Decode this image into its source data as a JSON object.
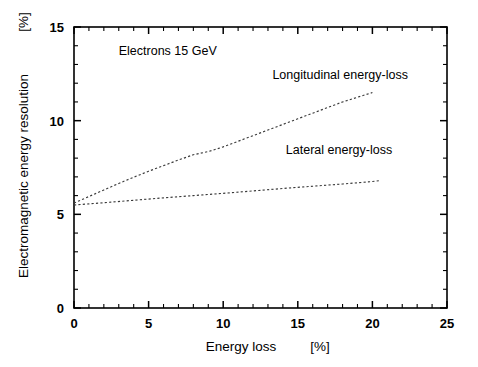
{
  "chart_data": {
    "type": "line",
    "title": "",
    "xlabel": "Energy loss",
    "xunit": "[%]",
    "ylabel": "Electromagnetic energy resolution",
    "yunit": "[%]",
    "xlim": [
      0,
      25
    ],
    "ylim": [
      0,
      15
    ],
    "grid": false,
    "legend_position": "inline-annotations",
    "x_ticks": [
      0,
      5,
      10,
      15,
      20,
      25
    ],
    "x_tick_labels": [
      "0",
      "5",
      "10",
      "15",
      "20",
      "25"
    ],
    "x_minor_tick_step": 1,
    "y_ticks": [
      0,
      5,
      10,
      15
    ],
    "y_tick_labels": [
      "0",
      "5",
      "10",
      "15"
    ],
    "y_minor_tick_step": 1,
    "annotations": [
      {
        "text": "Electrons  15 GeV",
        "x": 3.0,
        "y": 13.5
      },
      {
        "text": "Longitudinal energy-loss",
        "x": 13.3,
        "y": 12.2
      },
      {
        "text": "Lateral energy-loss",
        "x": 14.2,
        "y": 8.2
      }
    ],
    "series": [
      {
        "name": "Longitudinal energy-loss",
        "style": "dashed",
        "color": "#3a3a3a",
        "x": [
          0,
          1,
          2,
          3,
          4,
          5,
          6,
          7,
          8,
          9,
          10,
          11,
          12,
          13,
          14,
          15,
          16,
          17,
          18,
          19,
          20
        ],
        "y": [
          5.6,
          5.95,
          6.3,
          6.65,
          6.98,
          7.3,
          7.6,
          7.9,
          8.18,
          8.35,
          8.6,
          8.9,
          9.2,
          9.5,
          9.8,
          10.1,
          10.4,
          10.7,
          11.0,
          11.25,
          11.5
        ]
      },
      {
        "name": "Lateral energy-loss",
        "style": "dashed",
        "color": "#3a3a3a",
        "x": [
          0,
          2,
          4,
          6,
          8,
          10,
          12,
          14,
          16,
          18,
          20,
          20.5
        ],
        "y": [
          5.5,
          5.62,
          5.75,
          5.88,
          6.0,
          6.12,
          6.25,
          6.38,
          6.5,
          6.62,
          6.75,
          6.8
        ]
      }
    ]
  },
  "labels": {
    "y_axis_title": "Electromagnetic energy resolution",
    "y_axis_unit": "[%]",
    "x_axis_title": "Energy loss",
    "x_axis_unit": "[%]"
  }
}
